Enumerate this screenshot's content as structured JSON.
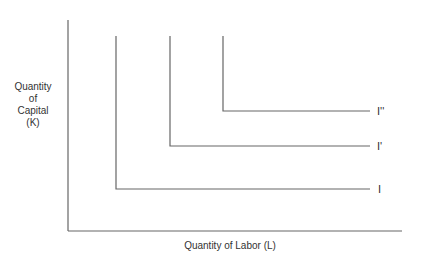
{
  "diagram": {
    "type": "isoquant map (perfect complements, L-shaped isoquants)",
    "y_axis_label": "Quantity\nof\nCapital\n(K)",
    "y_axis_lines": [
      "Quantity",
      "of",
      "Capital",
      "(K)"
    ],
    "x_axis_label": "Quantity of Labor (L)",
    "isoquants": [
      {
        "label": "I",
        "corner_x": 116,
        "corner_y": 189
      },
      {
        "label": "I'",
        "corner_x": 170,
        "corner_y": 146
      },
      {
        "label": "I''",
        "corner_x": 223,
        "corner_y": 111
      }
    ],
    "line_color": "#666666"
  }
}
